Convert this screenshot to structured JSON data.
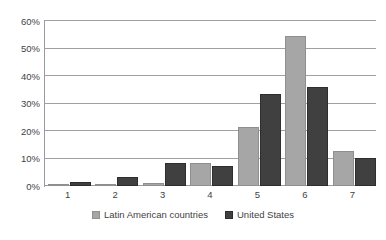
{
  "chart_data": {
    "type": "bar",
    "title": "",
    "subtitle": "",
    "xlabel": "",
    "ylabel": "",
    "categories": [
      "1",
      "2",
      "3",
      "4",
      "5",
      "6",
      "7"
    ],
    "series": [
      {
        "name": "Latin American countries",
        "color": "#a6a6a6",
        "values": [
          0.4,
          0.6,
          1.1,
          8.3,
          21.5,
          54.6,
          12.8
        ]
      },
      {
        "name": "United States",
        "color": "#404040",
        "values": [
          1.5,
          3.1,
          8.3,
          7.2,
          33.4,
          36.0,
          10.2
        ]
      }
    ],
    "ylim": [
      0,
      60
    ],
    "y_ticks": [
      0,
      10,
      20,
      30,
      40,
      50,
      60
    ],
    "y_tick_labels": [
      "0%",
      "10%",
      "20%",
      "30%",
      "40%",
      "50%",
      "60%"
    ],
    "grid": true,
    "grid_axis": "y",
    "legend_position": "bottom",
    "legend_entries": [
      "Latin American countries",
      "United States"
    ],
    "annotations": []
  },
  "colors": {
    "series_0": "#a6a6a6",
    "series_1": "#404040",
    "grid": "#a0a0a0",
    "axis": "#9a9a9a",
    "text": "#3f3f3f",
    "background": "#ffffff"
  }
}
